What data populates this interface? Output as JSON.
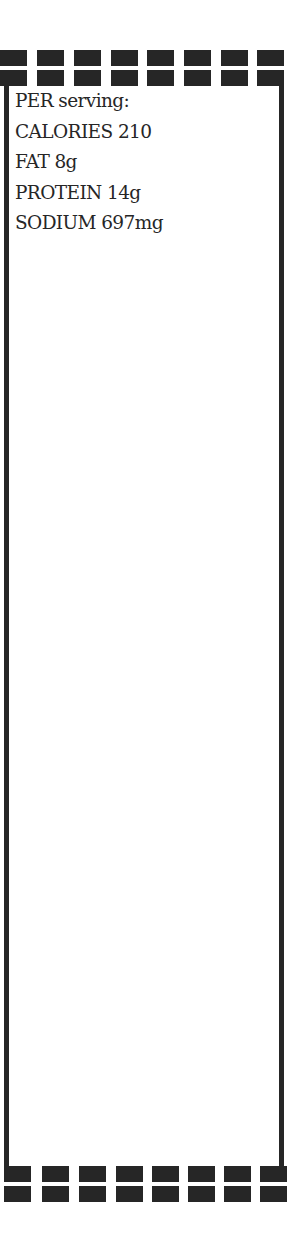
{
  "card": {
    "heading": "PER serving:",
    "nutrients": [
      {
        "label": "CALORIES",
        "value": "210"
      },
      {
        "label": "FAT",
        "value": "8g"
      },
      {
        "label": "PROTEIN",
        "value": "14g"
      },
      {
        "label": "SODIUM",
        "value": "697mg"
      }
    ]
  },
  "colors": {
    "ink": "#262626",
    "background": "#ffffff"
  }
}
